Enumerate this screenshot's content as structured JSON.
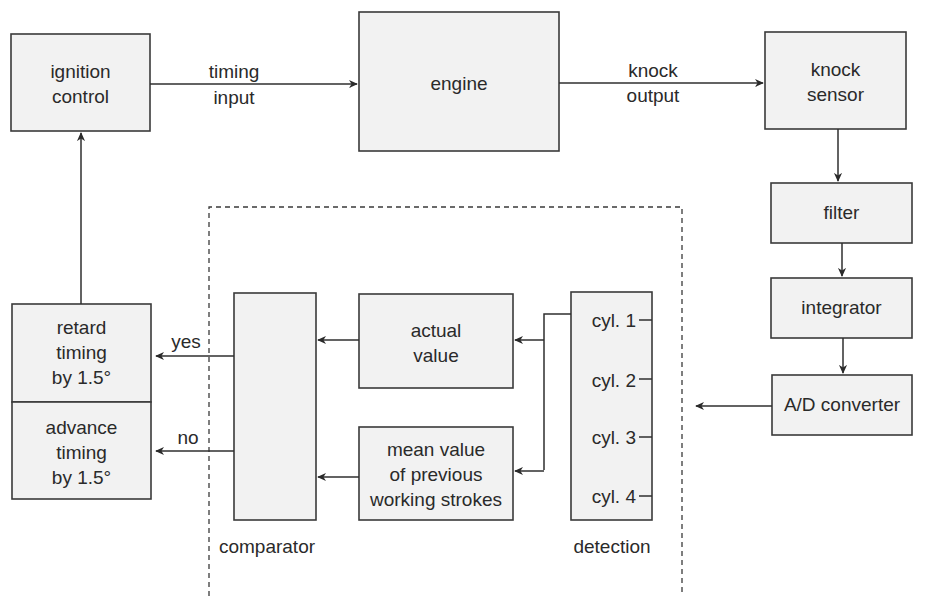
{
  "diagram": {
    "nodes": {
      "ignition_control": [
        "ignition",
        "control"
      ],
      "engine": [
        "engine"
      ],
      "knock_sensor": [
        "knock",
        "sensor"
      ],
      "filter": [
        "filter"
      ],
      "integrator": [
        "integrator"
      ],
      "ad_converter": [
        "A/D converter"
      ],
      "retard_timing": [
        "retard",
        "timing",
        "by 1.5°"
      ],
      "advance_timing": [
        "advance",
        "timing",
        "by 1.5°"
      ],
      "actual_value": [
        "actual",
        "value"
      ],
      "mean_value": [
        "mean value",
        "of previous",
        "working strokes"
      ],
      "detection_cylinders": [
        "cyl. 1",
        "cyl. 2",
        "cyl. 3",
        "cyl. 4"
      ]
    },
    "captions": {
      "comparator": "comparator",
      "detection": "detection"
    },
    "edge_labels": {
      "timing_input": [
        "timing",
        "input"
      ],
      "knock_output": [
        "knock",
        "output"
      ],
      "yes": "yes",
      "no": "no"
    },
    "edges": [
      {
        "from": "ignition control",
        "to": "engine",
        "label": "timing input"
      },
      {
        "from": "engine",
        "to": "knock sensor",
        "label": "knock output"
      },
      {
        "from": "knock sensor",
        "to": "filter"
      },
      {
        "from": "filter",
        "to": "integrator"
      },
      {
        "from": "integrator",
        "to": "A/D converter"
      },
      {
        "from": "A/D converter",
        "to": "detection"
      },
      {
        "from": "detection (cyl. 1)",
        "to": "actual value"
      },
      {
        "from": "detection (cyl. 1)",
        "to": "mean value of previous working strokes"
      },
      {
        "from": "actual value",
        "to": "comparator"
      },
      {
        "from": "mean value of previous working strokes",
        "to": "comparator"
      },
      {
        "from": "comparator",
        "to": "retard timing by 1.5°",
        "label": "yes"
      },
      {
        "from": "comparator",
        "to": "advance timing by 1.5°",
        "label": "no"
      },
      {
        "from": "retard/advance timing",
        "to": "ignition control"
      }
    ]
  }
}
